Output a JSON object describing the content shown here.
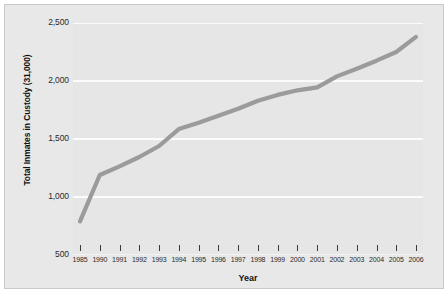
{
  "chart_data": {
    "type": "line",
    "title": "",
    "xlabel": "Year",
    "ylabel": "Total Inmates in Custody (31,000)",
    "xlim": [
      1985,
      2006
    ],
    "ylim": [
      500,
      2500
    ],
    "ytick_labels": [
      "2,500",
      "2,000",
      "1,500",
      "1,000",
      "500"
    ],
    "ytick_values": [
      2500,
      2000,
      1500,
      1000,
      500
    ],
    "grid": true,
    "legend": "none",
    "line_color": "#9b9b9b",
    "plot_background": "#e6e6e6",
    "gridline_color": "#fbfbfb",
    "categories": [
      "1985",
      "1990",
      "1991",
      "1992",
      "1993",
      "1994",
      "1995",
      "1996",
      "1997",
      "1998",
      "1999",
      "2000",
      "2001",
      "2002",
      "2003",
      "2004",
      "2005",
      "2006"
    ],
    "values": [
      790,
      1190,
      1265,
      1345,
      1440,
      1585,
      1640,
      1700,
      1760,
      1830,
      1880,
      1920,
      1945,
      2040,
      2105,
      2175,
      2250,
      2380
    ],
    "series": [
      {
        "name": "Total Inmates in Custody",
        "values": [
          790,
          1190,
          1265,
          1345,
          1440,
          1585,
          1640,
          1700,
          1760,
          1830,
          1880,
          1920,
          1945,
          2040,
          2105,
          2175,
          2250,
          2380
        ]
      }
    ]
  }
}
